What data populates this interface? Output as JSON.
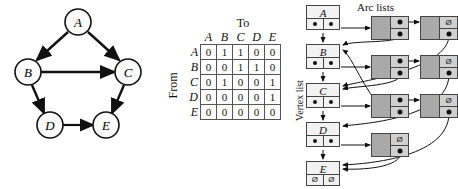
{
  "graph": {
    "caption": "",
    "vertices": [
      {
        "id": "A",
        "label": "A",
        "cx": 78,
        "cy": 22
      },
      {
        "id": "B",
        "label": "B",
        "cx": 28,
        "cy": 72
      },
      {
        "id": "C",
        "label": "C",
        "cx": 128,
        "cy": 72
      },
      {
        "id": "D",
        "label": "D",
        "cx": 50,
        "cy": 125
      },
      {
        "id": "E",
        "label": "E",
        "cx": 106,
        "cy": 125
      }
    ],
    "edges": [
      {
        "from": "A",
        "to": "B",
        "directed": true
      },
      {
        "from": "A",
        "to": "C",
        "directed": true
      },
      {
        "from": "B",
        "to": "C",
        "directed": "both"
      },
      {
        "from": "B",
        "to": "D",
        "directed": true
      },
      {
        "from": "C",
        "to": "E",
        "directed": true
      },
      {
        "from": "D",
        "to": "E",
        "directed": true
      }
    ]
  },
  "matrix": {
    "to_label": "To",
    "from_label": "From",
    "columns": [
      "A",
      "B",
      "C",
      "D",
      "E"
    ],
    "rows": [
      "A",
      "B",
      "C",
      "D",
      "E"
    ],
    "values": [
      [
        0,
        1,
        1,
        0,
        0
      ],
      [
        0,
        0,
        1,
        1,
        0
      ],
      [
        0,
        1,
        0,
        0,
        1
      ],
      [
        0,
        0,
        0,
        0,
        1
      ],
      [
        0,
        0,
        0,
        0,
        0
      ]
    ]
  },
  "adjacency_lists": {
    "arc_lists_title": "Arc lists",
    "vertex_list_title": "Vertex list",
    "null_glyph": "Ø",
    "vertices": [
      {
        "label": "A",
        "next_vertex": "dot",
        "arc_head": "dot",
        "arcs": [
          "dot",
          "null"
        ]
      },
      {
        "label": "B",
        "next_vertex": "dot",
        "arc_head": "dot",
        "arcs": [
          "dot",
          "null"
        ]
      },
      {
        "label": "C",
        "next_vertex": "dot",
        "arc_head": "dot",
        "arcs": [
          "dot",
          "null"
        ]
      },
      {
        "label": "D",
        "next_vertex": "dot",
        "arc_head": "dot",
        "arcs": [
          "null"
        ]
      },
      {
        "label": "E",
        "next_vertex": "null",
        "arc_head": "null",
        "arcs": []
      }
    ]
  }
}
